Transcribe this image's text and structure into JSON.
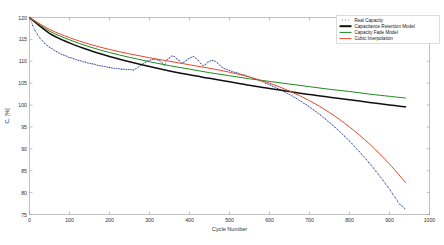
{
  "chart_data": {
    "type": "line",
    "title": "",
    "xlabel": "Cycle Number",
    "ylabel": "C_r [%]",
    "ylabel_display": "C",
    "ylabel_sub": "r",
    "ylabel_unit": " [%]",
    "xlim": [
      0,
      1000
    ],
    "ylim": [
      75,
      120
    ],
    "xticks": [
      0,
      100,
      200,
      300,
      400,
      500,
      600,
      700,
      800,
      900,
      1000
    ],
    "xtick_labels": [
      "0",
      "100",
      "200",
      "300",
      "400",
      "500",
      "600",
      "700",
      "800",
      "900",
      "1000"
    ],
    "yticks": [
      75,
      80,
      85,
      90,
      95,
      100,
      105,
      110,
      115,
      120
    ],
    "ytick_labels": [
      "75",
      "80",
      "85",
      "90",
      "95",
      "100",
      "105",
      "110",
      "115",
      "120"
    ],
    "grid": false,
    "legend_position": "top-right",
    "colors": {
      "real_capacity": "#2b3f9e",
      "capacitance_retention": "#101010",
      "capacity_fade": "#1f8a1f",
      "cubic_interpolation": "#e8462c"
    },
    "series": [
      {
        "name": "Real Capacity",
        "style": "dotted-markers",
        "color": "#2b3f9e",
        "x": [
          2,
          8,
          14,
          20,
          26,
          32,
          38,
          44,
          50,
          56,
          62,
          68,
          74,
          80,
          86,
          92,
          98,
          104,
          110,
          116,
          122,
          128,
          134,
          140,
          146,
          152,
          158,
          164,
          170,
          176,
          182,
          188,
          194,
          200,
          206,
          212,
          218,
          224,
          230,
          236,
          242,
          248,
          254,
          260,
          266,
          272,
          278,
          284,
          290,
          296,
          302,
          308,
          314,
          320,
          326,
          332,
          338,
          344,
          350,
          356,
          362,
          368,
          374,
          380,
          386,
          392,
          398,
          404,
          410,
          416,
          422,
          428,
          434,
          440,
          446,
          452,
          458,
          464,
          470,
          476,
          482,
          488,
          494,
          500,
          506,
          512,
          518,
          524,
          530,
          536,
          542,
          548,
          554,
          560,
          566,
          572,
          578,
          584,
          590,
          596,
          602,
          608,
          614,
          620,
          626,
          632,
          638,
          644,
          650,
          656,
          662,
          668,
          674,
          680,
          686,
          692,
          698,
          704,
          710,
          716,
          722,
          728,
          734,
          740,
          746,
          752,
          758,
          764,
          770,
          776,
          782,
          788,
          794,
          800,
          806,
          812,
          818,
          824,
          830,
          836,
          842,
          848,
          854,
          860,
          866,
          872,
          878,
          884,
          890,
          896,
          902,
          908,
          914,
          920,
          926,
          932,
          938
        ],
        "y": [
          119.6,
          118.2,
          117.0,
          116.1,
          115.3,
          114.7,
          114.1,
          113.6,
          113.2,
          112.9,
          112.5,
          112.2,
          111.9,
          111.6,
          111.4,
          111.2,
          110.9,
          110.8,
          110.6,
          110.4,
          110.2,
          110.1,
          109.9,
          109.8,
          109.6,
          109.5,
          109.4,
          109.3,
          109.1,
          109.0,
          108.9,
          108.8,
          108.7,
          108.6,
          108.5,
          108.4,
          108.4,
          108.3,
          108.2,
          108.2,
          108.1,
          108.1,
          108.1,
          108.0,
          108.3,
          108.7,
          109.1,
          109.5,
          109.8,
          110.1,
          110.3,
          110.4,
          110.5,
          110.3,
          110.1,
          109.6,
          109.1,
          110.4,
          110.8,
          111.2,
          111.1,
          110.6,
          110.2,
          109.6,
          109.8,
          110.2,
          110.6,
          110.9,
          111.1,
          110.7,
          110.2,
          109.5,
          109.0,
          109.3,
          109.8,
          110.1,
          110.2,
          110.0,
          109.6,
          109.1,
          108.6,
          108.3,
          108.1,
          107.9,
          107.7,
          107.5,
          107.4,
          107.2,
          107.0,
          106.9,
          106.7,
          106.5,
          106.3,
          106.1,
          105.9,
          105.7,
          105.5,
          105.3,
          105.0,
          104.8,
          104.6,
          104.3,
          104.1,
          103.8,
          103.6,
          103.3,
          103.0,
          102.7,
          102.4,
          102.1,
          101.8,
          101.5,
          101.1,
          100.8,
          100.4,
          100.1,
          99.7,
          99.3,
          98.9,
          98.5,
          98.1,
          97.7,
          97.2,
          96.8,
          96.3,
          95.9,
          95.4,
          94.9,
          94.4,
          93.9,
          93.4,
          92.9,
          92.3,
          91.8,
          91.2,
          90.6,
          90.0,
          89.4,
          88.8,
          88.2,
          87.6,
          86.9,
          86.3,
          85.6,
          84.9,
          84.2,
          83.5,
          82.8,
          82.0,
          81.3,
          80.5,
          79.7,
          78.9,
          78.1,
          77.3,
          76.9,
          76.3
        ]
      },
      {
        "name": "Capacitance Retention Model",
        "style": "solid",
        "color": "#101010",
        "x": [
          0,
          50,
          100,
          150,
          200,
          250,
          300,
          350,
          400,
          450,
          500,
          550,
          600,
          650,
          700,
          750,
          800,
          850,
          900,
          940
        ],
        "y": [
          120.0,
          116.4,
          114.2,
          112.5,
          111.1,
          109.9,
          108.8,
          107.8,
          106.9,
          106.1,
          105.3,
          104.5,
          103.8,
          103.1,
          102.4,
          101.8,
          101.2,
          100.6,
          100.0,
          99.6
        ]
      },
      {
        "name": "Capacity Fade Model",
        "style": "solid",
        "color": "#1f8a1f",
        "x": [
          0,
          50,
          100,
          150,
          200,
          250,
          300,
          350,
          400,
          450,
          500,
          550,
          600,
          650,
          700,
          750,
          800,
          850,
          900,
          940
        ],
        "y": [
          120.0,
          116.9,
          114.9,
          113.3,
          112.0,
          110.9,
          109.9,
          109.0,
          108.2,
          107.4,
          106.7,
          106.0,
          105.4,
          104.8,
          104.2,
          103.6,
          103.1,
          102.5,
          102.0,
          101.6
        ]
      },
      {
        "name": "Cubic Interpolation",
        "style": "solid",
        "color": "#e8462c",
        "x": [
          0,
          50,
          100,
          150,
          200,
          250,
          300,
          350,
          400,
          450,
          500,
          550,
          600,
          650,
          700,
          750,
          800,
          850,
          900,
          940
        ],
        "y": [
          120.0,
          117.3,
          115.4,
          113.9,
          112.7,
          111.7,
          110.8,
          110.0,
          109.2,
          108.4,
          107.5,
          106.4,
          105.0,
          103.2,
          101.0,
          98.3,
          95.0,
          91.1,
          86.5,
          82.3
        ]
      }
    ],
    "legend": [
      {
        "label": "Real Capacity",
        "color": "#2b3f9e",
        "style": "dotted"
      },
      {
        "label": "Capacitance Retention Model",
        "color": "#101010",
        "style": "thick-solid"
      },
      {
        "label": "Capacity Fade Model",
        "color": "#1f8a1f",
        "style": "solid"
      },
      {
        "label": "Cubic Interpolation",
        "color": "#e8462c",
        "style": "solid"
      }
    ]
  }
}
